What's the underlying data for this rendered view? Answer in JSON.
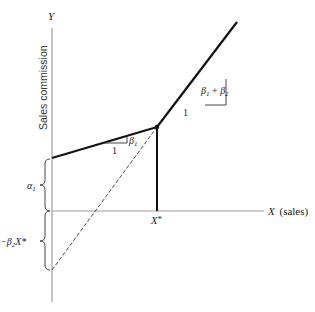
{
  "diagram": {
    "y_axis_label": "Y",
    "y_axis_title": "Sales commission",
    "x_axis_label": "X",
    "x_axis_title": "(sales)",
    "x_star_label": "X*",
    "x_star_symbol": "X",
    "x_star_mark": "*",
    "alpha_label": "α",
    "alpha_sub": "1",
    "neg_label": "−β",
    "neg_sub": "2",
    "neg_tail": "X*",
    "slope1": {
      "run_label": "1",
      "rise_symbol": "β",
      "rise_sub": "1"
    },
    "slope2": {
      "run_label": "1",
      "rise_symbol": "β",
      "rise_sub1": "1",
      "plus": " + ",
      "rise_symbol2": "β",
      "rise_sub2": "2"
    },
    "colors": {
      "axis": "#8a8a8a",
      "line": "#111111",
      "dashed": "#333333",
      "text": "#222222"
    }
  }
}
